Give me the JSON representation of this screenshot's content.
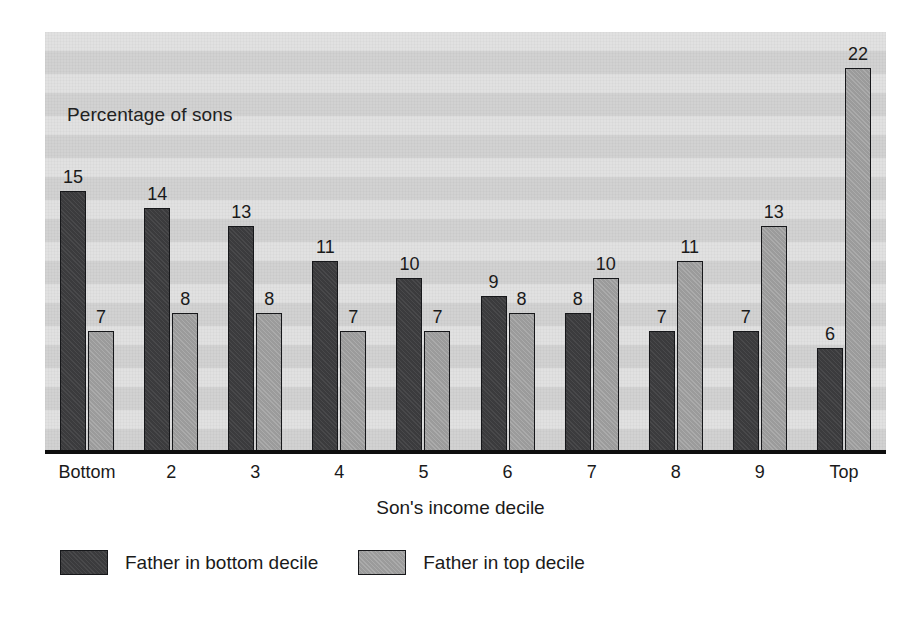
{
  "chart_data": {
    "type": "bar",
    "title": "",
    "subtitle": "",
    "panel_note": "Percentage of sons",
    "xlabel": "Son's income decile",
    "ylabel": "",
    "ylim": [
      0,
      24
    ],
    "grid": false,
    "grid_note": "no gridlines; panel has horizontal scan banding only",
    "legend_position": "below-plot-left",
    "categories": [
      "Bottom",
      "2",
      "3",
      "4",
      "5",
      "6",
      "7",
      "8",
      "9",
      "Top"
    ],
    "series": [
      {
        "name": "Father in bottom decile",
        "color": "#3b3b3d",
        "values": [
          15,
          14,
          13,
          11,
          10,
          9,
          8,
          7,
          7,
          6
        ]
      },
      {
        "name": "Father in top decile",
        "color": "#9b9b9b",
        "values": [
          7,
          8,
          8,
          7,
          7,
          8,
          10,
          11,
          13,
          22
        ]
      }
    ],
    "value_labels_shown": true,
    "units": "percent"
  },
  "legend": {
    "entries": [
      {
        "label": "Father in bottom decile",
        "swatch": "dark"
      },
      {
        "label": "Father in top decile",
        "swatch": "light"
      }
    ]
  },
  "colors": {
    "panel_background": "#d2d2d2",
    "page_background": "#ffffff",
    "axis": "#0e0e0e",
    "text": "#1a1a1a",
    "series_dark": "#3b3b3d",
    "series_light": "#9b9b9b"
  }
}
